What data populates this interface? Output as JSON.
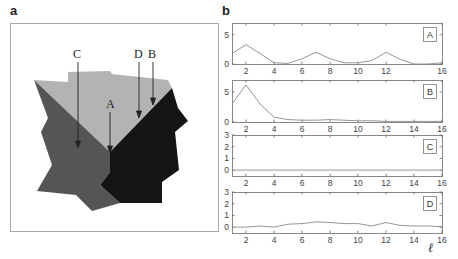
{
  "panel_a": {
    "label": "a",
    "arrow_labels": [
      "C",
      "A",
      "D",
      "B"
    ],
    "colors": {
      "light": "#b0b0b0",
      "mid": "#555555",
      "dark": "#161616",
      "frame": "#a9a9a9"
    }
  },
  "panel_b": {
    "label": "b",
    "xlabel": "ℓ"
  },
  "chart_data": [
    {
      "type": "line",
      "title": "A",
      "x": [
        1,
        2,
        3,
        4,
        5,
        6,
        7,
        8,
        9,
        10,
        11,
        12,
        13,
        14,
        15,
        16
      ],
      "values": [
        1.8,
        3.3,
        1.8,
        0.2,
        0.1,
        0.9,
        2.0,
        0.9,
        0.2,
        0.2,
        0.6,
        2.0,
        0.8,
        0.0,
        0.0,
        0.2
      ],
      "xlim": [
        1,
        16
      ],
      "ylim": [
        0,
        7
      ],
      "xticks": [
        2,
        4,
        6,
        8,
        10,
        12,
        16
      ],
      "yticks": [
        0,
        5
      ],
      "legend": "A"
    },
    {
      "type": "line",
      "title": "B",
      "x": [
        1,
        2,
        3,
        4,
        5,
        6,
        7,
        8,
        9,
        10,
        11,
        12,
        13,
        14,
        15,
        16
      ],
      "values": [
        3.0,
        6.2,
        3.0,
        0.8,
        0.4,
        0.3,
        0.3,
        0.4,
        0.3,
        0.2,
        0.2,
        0.1,
        0.1,
        0.1,
        0.1,
        0.1
      ],
      "xlim": [
        1,
        16
      ],
      "ylim": [
        0,
        7
      ],
      "xticks": [
        2,
        4,
        6,
        8,
        10,
        12,
        14,
        16
      ],
      "yticks": [
        0,
        5
      ],
      "legend": "B"
    },
    {
      "type": "line",
      "title": "C",
      "x": [
        1,
        2,
        3,
        4,
        5,
        6,
        7,
        8,
        9,
        10,
        11,
        12,
        13,
        14,
        15,
        16
      ],
      "values": [
        0,
        0,
        0,
        0,
        0,
        0,
        0,
        0,
        0,
        0,
        0,
        0,
        0,
        0,
        0,
        0
      ],
      "xlim": [
        1,
        16
      ],
      "ylim": [
        -0.5,
        3
      ],
      "xticks": [
        2,
        4,
        6,
        8,
        10,
        12,
        14,
        16
      ],
      "yticks": [
        0,
        1,
        2,
        3
      ],
      "legend": "C"
    },
    {
      "type": "line",
      "title": "D",
      "x": [
        1,
        2,
        3,
        4,
        5,
        6,
        7,
        8,
        9,
        10,
        11,
        12,
        13,
        14,
        15,
        16
      ],
      "values": [
        0.0,
        0.0,
        0.1,
        0.0,
        0.25,
        0.3,
        0.45,
        0.4,
        0.3,
        0.3,
        0.1,
        0.4,
        0.15,
        0.1,
        0.1,
        0.05
      ],
      "xlim": [
        1,
        16
      ],
      "ylim": [
        -0.5,
        3
      ],
      "xticks": [
        2,
        4,
        6,
        8,
        10,
        12,
        14,
        16
      ],
      "yticks": [
        0,
        1,
        2,
        3
      ],
      "xlabel": "ℓ",
      "legend": "D"
    }
  ]
}
